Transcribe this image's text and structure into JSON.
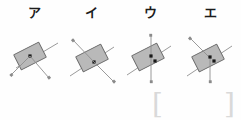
{
  "sheet": {
    "title": "Physics multiple-choice figure options",
    "background_color": "#fefefe"
  },
  "options": [
    {
      "label": "ア",
      "name": "option-a",
      "block": {
        "fill_color": "#b9b9b9",
        "stroke_color": "#6b6b6b",
        "tilt_deg": -27
      },
      "dots": 1,
      "vectors": [
        {
          "name": "line-upper-right",
          "arrowhead": false,
          "direction": "upper-right"
        },
        {
          "name": "arrow-lower-left",
          "arrowhead": true,
          "direction": "lower-left"
        },
        {
          "name": "arrow-lower-right",
          "arrowhead": true,
          "direction": "lower-right"
        }
      ]
    },
    {
      "label": "イ",
      "name": "option-b",
      "block": {
        "fill_color": "#b9b9b9",
        "stroke_color": "#6b6b6b",
        "tilt_deg": -27
      },
      "dots": 1,
      "vectors": [
        {
          "name": "arrow-upper-left",
          "arrowhead": true,
          "direction": "upper-left"
        },
        {
          "name": "arrow-lower-right",
          "arrowhead": true,
          "direction": "lower-right"
        },
        {
          "name": "line-upper-right",
          "arrowhead": false,
          "direction": "upper-right"
        }
      ]
    },
    {
      "label": "ウ",
      "name": "option-c",
      "block": {
        "fill_color": "#b9b9b9",
        "stroke_color": "#6b6b6b",
        "tilt_deg": -27
      },
      "dots": 2,
      "vectors": [
        {
          "name": "arrow-up",
          "arrowhead": true,
          "direction": "up"
        },
        {
          "name": "arrow-down",
          "arrowhead": true,
          "direction": "down"
        },
        {
          "name": "line-upper-right",
          "arrowhead": false,
          "direction": "upper-right"
        }
      ]
    },
    {
      "label": "エ",
      "name": "option-d",
      "block": {
        "fill_color": "#b9b9b9",
        "stroke_color": "#6b6b6b",
        "tilt_deg": -27
      },
      "dots": 2,
      "vectors": [
        {
          "name": "arrow-upper-left",
          "arrowhead": true,
          "direction": "upper-left"
        },
        {
          "name": "arrow-down",
          "arrowhead": true,
          "direction": "down"
        },
        {
          "name": "line-upper-right",
          "arrowhead": false,
          "direction": "upper-right"
        }
      ]
    }
  ],
  "answer_bracket": {
    "left": "[",
    "right": "]",
    "color": "#d9d9d9"
  }
}
